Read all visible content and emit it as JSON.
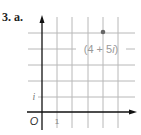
{
  "problem": {
    "label": "3. a."
  },
  "diagram": {
    "type": "complex-plane",
    "origin_label": "O",
    "x_tick_label": "1",
    "y_tick_label": "i",
    "point": {
      "re": 4,
      "im": 5,
      "label": "(4 + 5i)"
    },
    "colors": {
      "grid": "#b8b8b8",
      "axis": "#111111",
      "point": "#666666",
      "text": "#888888"
    }
  }
}
